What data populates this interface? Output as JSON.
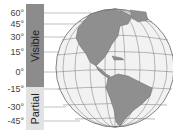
{
  "diagram": {
    "bands": [
      {
        "label": "Visible",
        "from_lat": 60,
        "to_lat": -15,
        "color": "#8c8c8c"
      },
      {
        "label": "Partial",
        "from_lat": -15,
        "to_lat": -45,
        "color": "#e2e2e2"
      }
    ],
    "ticks": [
      "60°",
      "45°",
      "30°",
      "15°",
      "0°",
      "-15°",
      "-30°",
      "-45°"
    ],
    "globe": {
      "view": "Western Hemisphere — Americas",
      "land_color": "#8f8f8f",
      "ocean_color": "#f2f2f2",
      "grid_color": "#777777"
    }
  }
}
